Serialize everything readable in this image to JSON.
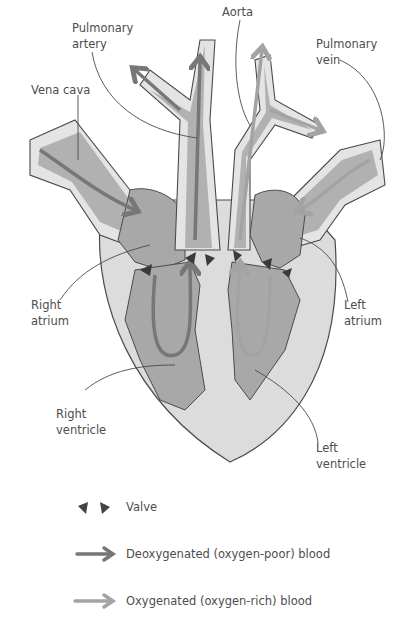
{
  "diagram": {
    "colors": {
      "heart_outer": "#dcdcdc",
      "heart_chamber": "#a8a8a8",
      "vessel_wall": "#e4e4e4",
      "outline": "#4a4a4a",
      "deoxygenated_arrow": "#777777",
      "oxygenated_arrow": "#a3a3a3",
      "valve": "#3a3a3a"
    },
    "labels": {
      "pulmonary_artery": "Pulmonary\nartery",
      "aorta": "Aorta",
      "pulmonary_vein": "Pulmonary\nvein",
      "vena_cava": "Vena cava",
      "right_atrium": "Right\natrium",
      "left_atrium": "Left\natrium",
      "right_ventricle": "Right\nventricle",
      "left_ventricle": "Left\nventricle"
    }
  },
  "legend": {
    "items": [
      {
        "icon": "valve-icon",
        "label": "Valve"
      },
      {
        "icon": "deoxygenated-arrow-icon",
        "label": "Deoxygenated (oxygen-poor) blood"
      },
      {
        "icon": "oxygenated-arrow-icon",
        "label": "Oxygenated (oxygen-rich) blood"
      }
    ]
  }
}
